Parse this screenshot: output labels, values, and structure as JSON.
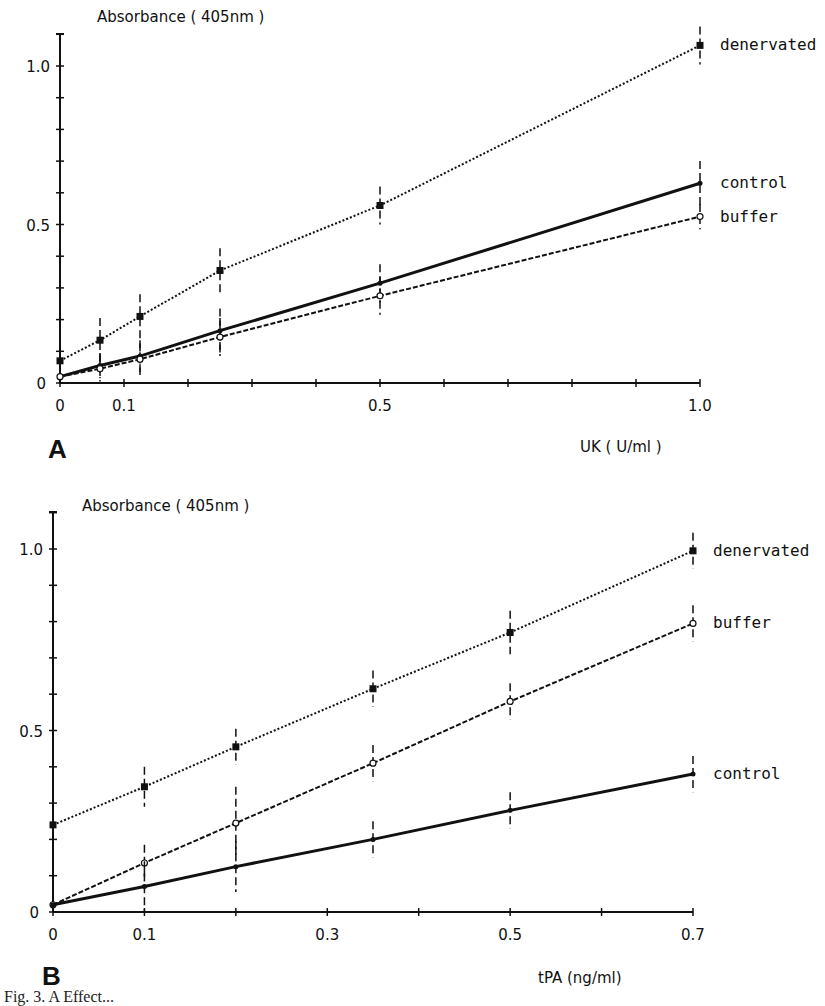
{
  "chart_data": [
    {
      "panel": "A",
      "type": "line",
      "title": "",
      "ylabel": "Absorbance ( 405nm )",
      "xlabel": "UK ( U/ml )",
      "xlim": [
        0,
        1.0
      ],
      "ylim": [
        0,
        1.1
      ],
      "x_tick_labels": [
        "0",
        "0.1",
        "0.5",
        "1.0"
      ],
      "y_tick_labels": [
        "0",
        "0.5",
        "1.0"
      ],
      "grid": false,
      "legend_position": "inline-right",
      "x": [
        0,
        0.0625,
        0.125,
        0.25,
        0.5,
        1.0
      ],
      "series": [
        {
          "name": "denervated",
          "style": "dotted",
          "marker": "filled-square",
          "values": [
            0.07,
            0.135,
            0.21,
            0.355,
            0.56,
            1.065
          ],
          "error": [
            0.0,
            0.07,
            0.07,
            0.07,
            0.06,
            0.06
          ]
        },
        {
          "name": "control",
          "style": "solid",
          "marker": "filled-dot",
          "values": [
            0.02,
            0.055,
            0.085,
            0.165,
            0.315,
            0.63
          ],
          "error": [
            0.0,
            0.04,
            0.05,
            0.07,
            0.06,
            0.07
          ]
        },
        {
          "name": "buffer",
          "style": "dashed",
          "marker": "open-circle",
          "values": [
            0.02,
            0.045,
            0.075,
            0.145,
            0.275,
            0.525
          ],
          "error": [
            0.0,
            0.04,
            0.05,
            0.06,
            0.06,
            0.04
          ]
        }
      ]
    },
    {
      "panel": "B",
      "type": "line",
      "title": "",
      "ylabel": "Absorbance ( 405nm )",
      "xlabel": "tPA (ng/ml)",
      "xlim": [
        0,
        0.7
      ],
      "ylim": [
        0,
        1.1
      ],
      "x_tick_labels": [
        "0",
        "0.1",
        "0.3",
        "0.5",
        "0.7"
      ],
      "y_tick_labels": [
        "0",
        "0.5",
        "1.0"
      ],
      "grid": false,
      "legend_position": "inline-right",
      "x": [
        0,
        0.1,
        0.2,
        0.35,
        0.5,
        0.7
      ],
      "series": [
        {
          "name": "denervated",
          "style": "dotted",
          "marker": "filled-square",
          "values": [
            0.24,
            0.345,
            0.455,
            0.615,
            0.77,
            0.995
          ],
          "error": [
            0.0,
            0.055,
            0.05,
            0.05,
            0.06,
            0.05
          ]
        },
        {
          "name": "buffer",
          "style": "dashed",
          "marker": "open-circle",
          "values": [
            0.02,
            0.135,
            0.245,
            0.41,
            0.58,
            0.795
          ],
          "error": [
            0.0,
            0.05,
            0.1,
            0.05,
            0.05,
            0.05
          ]
        },
        {
          "name": "control",
          "style": "solid",
          "marker": "filled-dot",
          "values": [
            0.02,
            0.07,
            0.125,
            0.2,
            0.28,
            0.38
          ],
          "error": [
            0.0,
            0.07,
            0.07,
            0.05,
            0.05,
            0.05
          ]
        }
      ]
    }
  ],
  "panels": {
    "a": {
      "label": "A",
      "ylabel": "Absorbance ( 405nm )",
      "xlabel": "UK ( U/ml )",
      "xticks": [
        "0",
        "0.1",
        "0.5",
        "1.0"
      ],
      "yticks": [
        "0",
        "0.5",
        "1.0"
      ],
      "legend": [
        "denervated",
        "control",
        "buffer"
      ]
    },
    "b": {
      "label": "B",
      "ylabel": "Absorbance ( 405nm )",
      "xlabel": "tPA (ng/ml)",
      "xticks": [
        "0",
        "0.1",
        "0.3",
        "0.5",
        "0.7"
      ],
      "yticks": [
        "0",
        "0.5",
        "1.0"
      ],
      "legend": [
        "denervated",
        "buffer",
        "control"
      ]
    }
  },
  "caption": "Fig. 3. A Effect..."
}
